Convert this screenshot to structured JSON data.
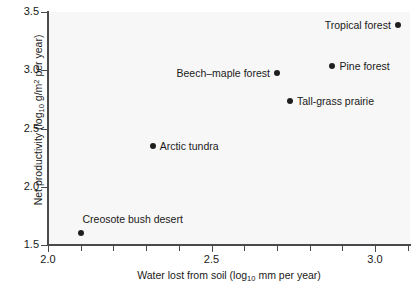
{
  "chart_data": {
    "type": "scatter",
    "title": "",
    "xlabel": "Water lost from soil (log10 mm per year)",
    "ylabel": "Net productivity (log10 g/m2 per year)",
    "xlim": [
      2.0,
      3.1
    ],
    "ylim": [
      1.5,
      3.5
    ],
    "grid": false,
    "legend": "none",
    "xticks": [
      "2.0",
      "2.5",
      "3.0"
    ],
    "xtick_values": [
      2.0,
      2.5,
      3.0
    ],
    "xminor_step": 0.1,
    "yticks": [
      "1.5",
      "2.0",
      "2.5",
      "3.0",
      "3.5"
    ],
    "ytick_values": [
      1.5,
      2.0,
      2.5,
      3.0,
      3.5
    ],
    "points": [
      {
        "label": "Creosote bush desert",
        "x": 2.1,
        "y": 1.6,
        "label_pos": "above"
      },
      {
        "label": "Arctic tundra",
        "x": 2.32,
        "y": 2.35,
        "label_pos": "right"
      },
      {
        "label": "Tall-grass prairie",
        "x": 2.74,
        "y": 2.74,
        "label_pos": "right"
      },
      {
        "label": "Beech–maple forest",
        "x": 2.7,
        "y": 2.98,
        "label_pos": "left"
      },
      {
        "label": "Pine forest",
        "x": 2.87,
        "y": 3.04,
        "label_pos": "right"
      },
      {
        "label": "Tropical forest",
        "x": 3.07,
        "y": 3.39,
        "label_pos": "left"
      }
    ]
  },
  "axes": {
    "x_title_prefix": "Water lost from soil (log",
    "x_title_sub": "10",
    "x_title_suffix": " mm per year)",
    "y_title_prefix": "Net productivity (log",
    "y_title_sub": "10",
    "y_title_mid": " g/m",
    "y_title_sup": "2",
    "y_title_suffix": " per year)"
  },
  "colors": {
    "point": "#1f1f1f",
    "axis": "#4a4a4a",
    "plot_background": "#f7f7f7",
    "figure_background": "#ffffff",
    "text": "#1a1a1a"
  }
}
